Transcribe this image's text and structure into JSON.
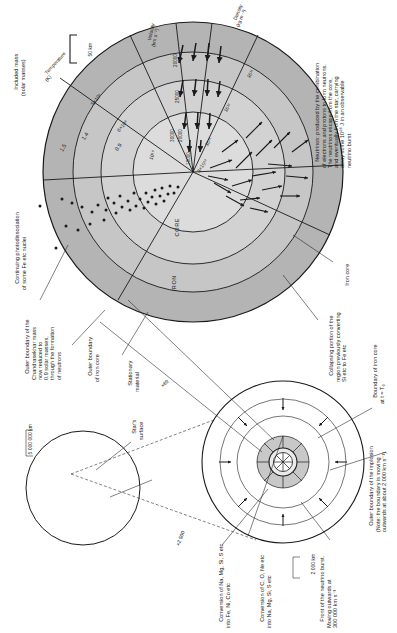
{
  "figure": {
    "domain_note": "Scientific illustration"
  },
  "main_diagram": {
    "scale_bar": "50 km",
    "region_labels": {
      "core": "CORE",
      "iron": "IRON"
    },
    "axes": {
      "included_mass": "Included mass\n(solar masses)",
      "temperature": "Temperature\n(K)",
      "velocity": "Velocity\n(km s⁻¹)",
      "density": "Density\n(kg m⁻³)"
    },
    "included_mass_values": [
      "1.5",
      "1.4",
      "0.9"
    ],
    "temperature_values": [
      "5×10⁹",
      "8×10⁹",
      "10¹⁰"
    ],
    "velocity_values": [
      "20000",
      "25000",
      "30000",
      "20000",
      "10000"
    ],
    "density_values": [
      "10¹¹",
      "10¹²",
      "10¹³",
      "3×10¹³"
    ],
    "annotations": [
      {
        "name": "neutrinos",
        "text": "Neutrinos: produced by the combination\nof electrons and protons to form neutrons.\nThe neutrinos escape from the core,\nand eventually from the star, carrying\naway some 10⁴⁶ J in an observable\nneutrino burst"
      },
      {
        "name": "photodissociation",
        "text": "Continuing photodissociation\nof some Fe etc nuclei"
      },
      {
        "name": "chandrasekhar-boundary",
        "text": "Outer boundary of the\nChandrasekhar mass\nnow reduced to\n0.9 solar masses,\nthrough the formation\nof neutrons"
      },
      {
        "name": "outer-boundary-iron-core",
        "text": "Outer boundary\nof iron core"
      },
      {
        "name": "iron-core-pointer",
        "text": "Iron core"
      },
      {
        "name": "collapsing-portion",
        "text": "Collapsing portion of the\nregion previously converting\nSi etc to Fe etc"
      }
    ]
  },
  "star_diagram": {
    "scale_bar": "5 000 000 km",
    "labels": [
      {
        "name": "stars-surface",
        "text": "Star's\nsurface"
      },
      {
        "name": "stationary-material",
        "text": "Stationary\nmaterial"
      }
    ]
  },
  "mid_diagram": {
    "scale_bar": "2 000 km",
    "labels": [
      {
        "name": "boundary-iron-core-t0",
        "text": "Boundary of iron core\nat t = T₀"
      },
      {
        "name": "outer-boundary-implosion",
        "text": "Outer boundary of the implosion\n(Note: the boundary is moving\noutwards at about 2 000 km s⁻¹)"
      },
      {
        "name": "neutrino-burst-front",
        "text": "Front of the neutrino burst.\nMoving outwards at\n300 000 km s⁻¹"
      },
      {
        "name": "conversion-c-o-ne",
        "text": "Conversion of C, O, Ne etc\ninto Na, Mg, Si, S etc"
      },
      {
        "name": "conversion-na-mg-si",
        "text": "Conversion of Na, Mg, Si, S etc\ninto Fe, Ni, Co etc"
      }
    ]
  },
  "magnifications": {
    "star_to_mid": "×2 500",
    "mid_to_main": "×69"
  },
  "colors": {
    "ink": "#1a1a1a",
    "shade_light": "#d8d8d8",
    "shade_mid": "#c6c6c6",
    "shade_dark": "#b4b4b4",
    "paper": "#ffffff"
  }
}
